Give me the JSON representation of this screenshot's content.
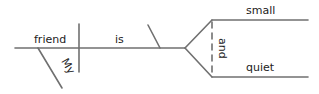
{
  "diagram": {
    "type": "sentence-diagram",
    "line_color": "#707070",
    "text_color": "#222222",
    "words": {
      "subject": "friend",
      "verb": "is",
      "modifier": "My",
      "complement_top": "small",
      "complement_bottom": "quiet",
      "conjunction": "and"
    }
  }
}
